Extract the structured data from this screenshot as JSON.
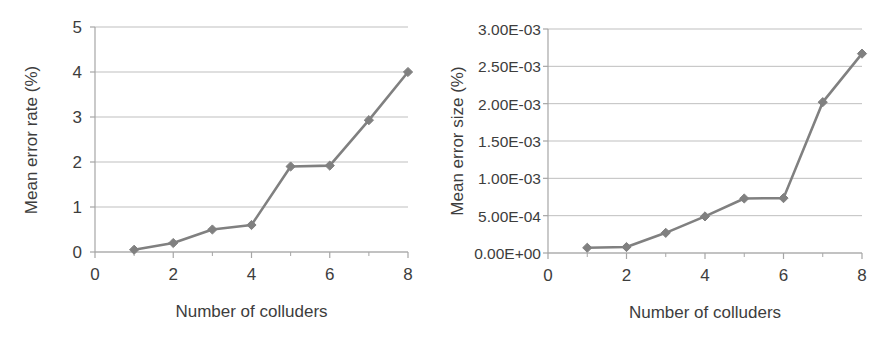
{
  "figure": {
    "panels": [
      "left",
      "right"
    ],
    "series_color": "#808080",
    "gridline_color": "#bfbfbf",
    "axis_color": "#a6a6a6",
    "text_color": "#3d3d3d"
  },
  "chart_data": [
    {
      "type": "line",
      "panel": "left",
      "title": "",
      "xlabel": "Number of colluders",
      "ylabel": "Mean error rate (%)",
      "x": [
        1,
        2,
        3,
        4,
        5,
        6,
        7,
        8
      ],
      "values": [
        0.05,
        0.2,
        0.5,
        0.6,
        1.9,
        1.92,
        2.93,
        4.0
      ],
      "xlim": [
        0,
        8
      ],
      "ylim": [
        0,
        5
      ],
      "xticks": [
        0,
        2,
        4,
        6,
        8
      ],
      "xtick_labels": [
        "0",
        "2",
        "4",
        "6",
        "8"
      ],
      "xminorticks": [
        1,
        3,
        5,
        7
      ],
      "yticks": [
        0,
        1,
        2,
        3,
        4,
        5
      ],
      "ytick_labels": [
        "0",
        "1",
        "2",
        "3",
        "4",
        "5"
      ],
      "grid": true,
      "legend": "none",
      "marker": "diamond",
      "series": [
        {
          "name": "Mean error rate",
          "values": [
            0.05,
            0.2,
            0.5,
            0.6,
            1.9,
            1.92,
            2.93,
            4.0
          ]
        }
      ]
    },
    {
      "type": "line",
      "panel": "right",
      "title": "",
      "xlabel": "Number of colluders",
      "ylabel": "Mean error size (%)",
      "x": [
        1,
        2,
        3,
        4,
        5,
        6,
        7,
        8
      ],
      "values": [
        7e-05,
        8e-05,
        0.00027,
        0.00049,
        0.00073,
        0.000735,
        0.00202,
        0.00267
      ],
      "xlim": [
        0,
        8
      ],
      "ylim": [
        0,
        0.003
      ],
      "xticks": [
        0,
        2,
        4,
        6,
        8
      ],
      "xtick_labels": [
        "0",
        "2",
        "4",
        "6",
        "8"
      ],
      "xminorticks": [
        1,
        3,
        5,
        7
      ],
      "yticks": [
        0,
        0.0005,
        0.001,
        0.0015,
        0.002,
        0.0025,
        0.003
      ],
      "ytick_labels": [
        "0.00E+00",
        "5.00E-04",
        "1.00E-03",
        "1.50E-03",
        "2.00E-03",
        "2.50E-03",
        "3.00E-03"
      ],
      "grid": true,
      "legend": "none",
      "marker": "diamond",
      "series": [
        {
          "name": "Mean error size",
          "values": [
            7e-05,
            8e-05,
            0.00027,
            0.00049,
            0.00073,
            0.000735,
            0.00202,
            0.00267
          ]
        }
      ]
    }
  ]
}
